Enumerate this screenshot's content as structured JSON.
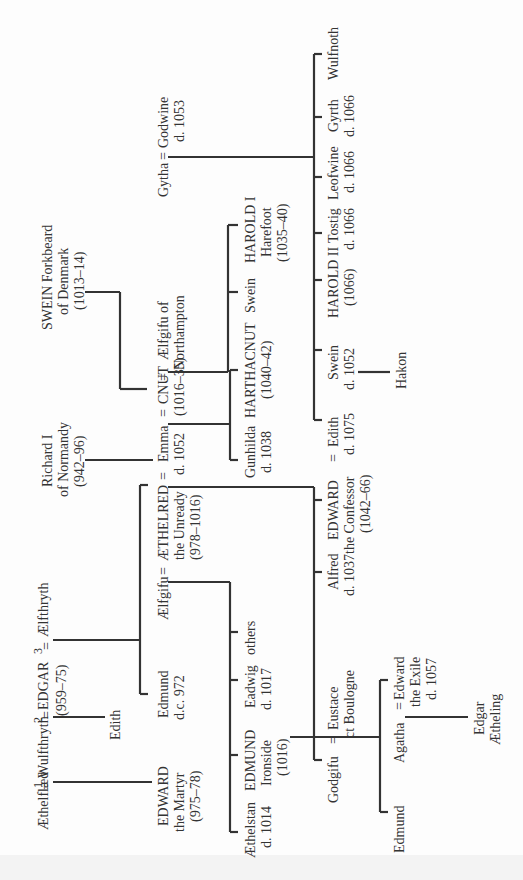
{
  "diagram": {
    "type": "genealogical-tree",
    "orientation": "rotated-90-ccw",
    "marriage_symbol": "=",
    "people": {
      "aethelflaed": [
        "Æthelflæd"
      ],
      "wulfthryth": [
        "Wulfthryth"
      ],
      "edgar": [
        "EDGAR",
        "(959–75)"
      ],
      "aelfthryth": [
        "Ælfthryth"
      ],
      "edith_nun": [
        "Edith"
      ],
      "edward_martyr": [
        "EDWARD",
        "the Martyr",
        "(975–78)"
      ],
      "edmund_972": [
        "Edmund",
        "d.c. 972"
      ],
      "aelfgifu": [
        "Ælfgifu"
      ],
      "aethelred": [
        "ÆTHELRED",
        "the Unready",
        "(978–1016)"
      ],
      "emma": [
        "Emma",
        "d. 1052"
      ],
      "richard": [
        "Richard I",
        "of Normandy",
        "(942–96)"
      ],
      "cnut": [
        "CNUT",
        "(1016–35)"
      ],
      "aelfgifu_n": [
        "Ælfgifu of",
        "Northampton"
      ],
      "swein_fb": [
        "SWEIN Forkbeard",
        "of Denmark",
        "(1013–14)"
      ],
      "gytha": [
        "Gytha"
      ],
      "godwine": [
        "Godwine",
        "d. 1053"
      ],
      "aethelstan": [
        "Æthelstan",
        "d. 1014"
      ],
      "edmund_ironside": [
        "EDMUND",
        "Ironside",
        "(1016)"
      ],
      "eadwig": [
        "Eadwig",
        "d. 1017"
      ],
      "others": [
        "others"
      ],
      "godgifu": [
        "Godgifu"
      ],
      "eustace": [
        "Eustace",
        "ct Boulogne"
      ],
      "alfred": [
        "Alfred",
        "d. 1037"
      ],
      "edward_confessor": [
        "EDWARD",
        "the Confessor",
        "(1042–66)"
      ],
      "edith_godwin": [
        "Edith",
        "d. 1075"
      ],
      "gunhilda": [
        "Gunhilda",
        "d. 1038"
      ],
      "harthacnut": [
        "HARTHACNUT",
        "(1040–42)"
      ],
      "swein_c": [
        "Swein"
      ],
      "harold_i": [
        "HAROLD I",
        "Harefoot",
        "(1035–40)"
      ],
      "swein_g": [
        "Swein",
        "d. 1052"
      ],
      "harold_ii": [
        "HAROLD II",
        "(1066)"
      ],
      "tostig": [
        "Tostig",
        "d. 1066"
      ],
      "leofwine": [
        "Leofwine",
        "d. 1066"
      ],
      "gyrth": [
        "Gyrth",
        "d. 1066"
      ],
      "wulfnoth": [
        "Wulfnoth"
      ],
      "hakon": [
        "Hakon"
      ],
      "edmund_son": [
        "Edmund"
      ],
      "agatha": [
        "Agatha"
      ],
      "edward_exile": [
        "Edward",
        "the Exile",
        "d. 1057"
      ],
      "edgar_aetheling": [
        "Edgar",
        "Ætheling"
      ]
    },
    "marriage_numbers": [
      "1",
      "2",
      "3"
    ]
  }
}
